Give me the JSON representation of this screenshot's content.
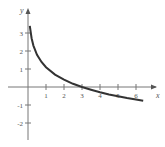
{
  "chart_data": {
    "type": "line",
    "title": "",
    "xlabel": "x",
    "ylabel": "y",
    "xlim": [
      -0.9,
      7.0
    ],
    "ylim": [
      -2.8,
      4.6
    ],
    "grid": false,
    "x_ticks": [
      1,
      2,
      3,
      4,
      5,
      6
    ],
    "x_tick_labels": [
      "1",
      "2",
      "3",
      "4",
      "5",
      "6"
    ],
    "y_ticks": [
      -2,
      -1,
      1,
      2,
      3
    ],
    "y_tick_labels": [
      "-2",
      "-1",
      "1",
      "2",
      "3"
    ],
    "series": [
      {
        "name": "y = ln 3 - ln x",
        "x": [
          0.1,
          0.2,
          0.3,
          0.5,
          0.75,
          1,
          1.5,
          2,
          2.5,
          3,
          3.5,
          4,
          4.5,
          5,
          5.5,
          6,
          6.4
        ],
        "values": [
          3.4,
          2.71,
          2.3,
          1.79,
          1.39,
          1.1,
          0.69,
          0.41,
          0.18,
          0.0,
          -0.15,
          -0.29,
          -0.41,
          -0.51,
          -0.61,
          -0.69,
          -0.76
        ]
      }
    ]
  },
  "labels": {
    "x_axis": "x",
    "y_axis": "y"
  }
}
